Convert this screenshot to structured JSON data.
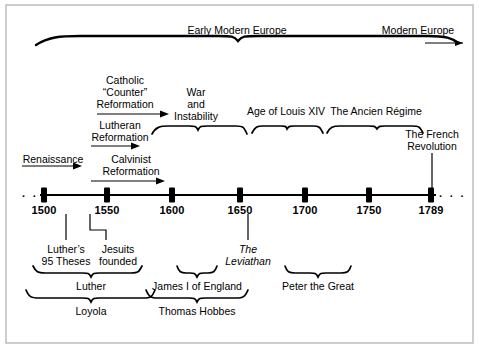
{
  "figure": {
    "line_color": "#000000",
    "background_color": "#ffffff",
    "border_color": "#b9b9b9"
  },
  "era_band": {
    "labels": [
      {
        "text": "Early Modern Europe",
        "x": 237,
        "y": 30
      },
      {
        "text": "Modern Europe",
        "x": 418,
        "y": 30
      }
    ]
  },
  "above_axis": {
    "period_labels": [
      {
        "name": "renaissance",
        "lines": [
          "Renaissance"
        ],
        "x": 53,
        "y": 150
      },
      {
        "name": "lutheran-reformation",
        "lines": [
          "Lutheran",
          "Reformation"
        ],
        "x": 120,
        "y": 120
      },
      {
        "name": "calvinist-reformation",
        "lines": [
          "Calvinist",
          "Reformation"
        ],
        "x": 131,
        "y": 155
      },
      {
        "name": "catholic-counter-reformation",
        "lines": [
          "Catholic",
          "“Counter”",
          "Reformation"
        ],
        "x": 125,
        "y": 77
      },
      {
        "name": "war-and-instability",
        "lines": [
          "War",
          "and",
          "Instability"
        ],
        "x": 196,
        "y": 89
      },
      {
        "name": "age-of-louis-xiv",
        "lines": [
          "Age of Louis XIV"
        ],
        "x": 286,
        "y": 109
      },
      {
        "name": "the-ancien-regime",
        "lines": [
          "The Ancien Régime"
        ],
        "x": 376,
        "y": 109
      },
      {
        "name": "the-french-revolution",
        "lines": [
          "The French",
          "Revolution"
        ],
        "x": 432,
        "y": 135
      }
    ]
  },
  "axis": {
    "ticks": [
      {
        "label": "1500",
        "x": 44
      },
      {
        "label": "1550",
        "x": 107
      },
      {
        "label": "1600",
        "x": 172
      },
      {
        "label": "1650",
        "x": 240
      },
      {
        "label": "1700",
        "x": 305
      },
      {
        "label": "1750",
        "x": 369
      },
      {
        "label": "1789",
        "x": 431
      }
    ],
    "y": 195,
    "label_y": 202,
    "left_ellipsis": "· · ·",
    "right_ellipsis": "· · ·"
  },
  "below_axis": {
    "event_labels": [
      {
        "name": "luthers-95-theses",
        "lines": [
          "Luther’s",
          "95 Theses"
        ],
        "x": 66,
        "y": 247
      },
      {
        "name": "jesuits-founded",
        "lines": [
          "Jesuits",
          "founded"
        ],
        "x": 118,
        "y": 247
      },
      {
        "name": "the-leviathan",
        "lines": [
          "The",
          "Leviathan"
        ],
        "x": 248,
        "y": 247,
        "italic": true
      }
    ],
    "figure_labels": [
      {
        "name": "luther",
        "text": "Luther",
        "x": 91,
        "y": 285
      },
      {
        "name": "james-i-of-england",
        "text": "James I of England",
        "x": 197,
        "y": 285
      },
      {
        "name": "peter-the-great",
        "text": "Peter the Great",
        "x": 318,
        "y": 285
      },
      {
        "name": "loyola",
        "text": "Loyola",
        "x": 91,
        "y": 309
      },
      {
        "name": "thomas-hobbes",
        "text": "Thomas Hobbes",
        "x": 197,
        "y": 309
      }
    ]
  }
}
